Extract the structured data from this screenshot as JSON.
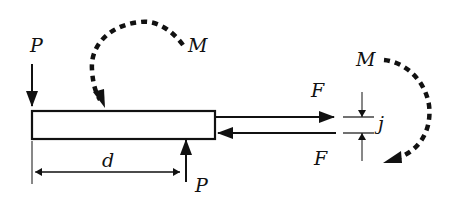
{
  "diagram": {
    "type": "free-body diagram of bonded joint / beam",
    "labels": {
      "p_left": "P",
      "p_bottom": "P",
      "m_left": "M",
      "m_right": "M",
      "d": "d",
      "f_top": "F",
      "f_bottom": "F",
      "j": "j"
    },
    "colors": {
      "stroke": "#111111",
      "background": "#ffffff"
    }
  }
}
